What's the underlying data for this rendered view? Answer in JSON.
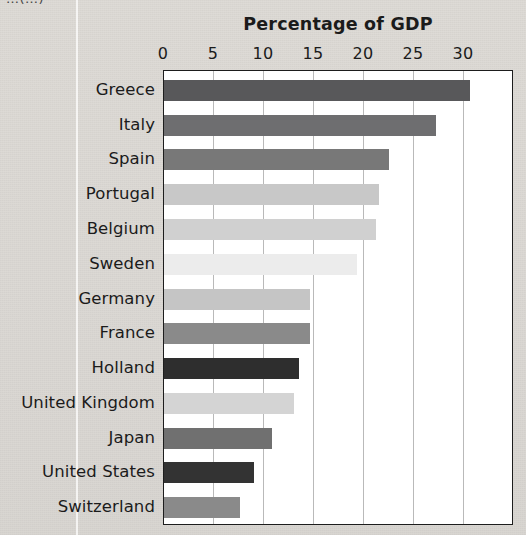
{
  "page": {
    "clipped_header_text": "…(…)"
  },
  "chart_data": {
    "type": "bar",
    "orientation": "horizontal",
    "title": "Percentage of GDP",
    "xlabel": "",
    "ylabel": "",
    "xlim": [
      0,
      35
    ],
    "xticks": [
      0,
      5,
      10,
      15,
      20,
      25,
      30
    ],
    "xtick_labels": [
      "0",
      "5",
      "10",
      "15",
      "20",
      "25",
      "30"
    ],
    "grid": "vertical",
    "legend": "none",
    "categories": [
      "Greece",
      "Italy",
      "Spain",
      "Portugal",
      "Belgium",
      "Sweden",
      "Germany",
      "France",
      "Holland",
      "United Kingdom",
      "Japan",
      "United States",
      "Switzerland"
    ],
    "values": [
      30.6,
      27.2,
      22.5,
      21.5,
      21.2,
      19.3,
      14.6,
      14.6,
      13.5,
      13.0,
      10.8,
      9.0,
      7.6
    ],
    "bar_colors": [
      "#58585a",
      "#6e6e70",
      "#787878",
      "#c8c8c8",
      "#d0d0d0",
      "#ececec",
      "#c5c5c5",
      "#8a8a8a",
      "#2e2e2e",
      "#d4d4d4",
      "#707070",
      "#333333",
      "#8a8a8a"
    ],
    "colors": {
      "plot_background": "#ffffff",
      "page_background": "#dcd9d4",
      "axis_line": "#1d1d1d",
      "gridline": "#b9b9b9",
      "text": "#1b1b1b"
    }
  }
}
